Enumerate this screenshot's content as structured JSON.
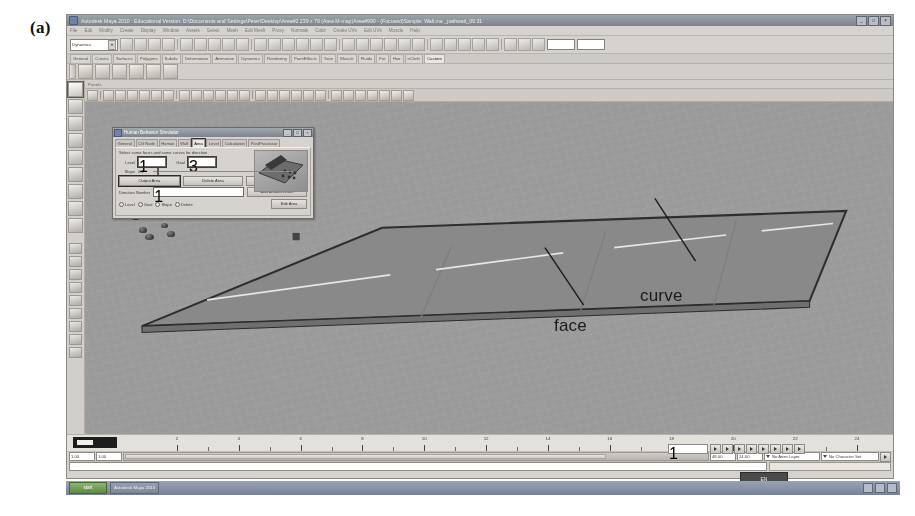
{
  "figure": {
    "label": "(a)"
  },
  "window": {
    "title": "Autodesk Maya 2010 : Educational Version: D:\\Documents and Settings\\Peter\\Desktop\\Area#2 239 x 79 (Area M-map)Area#990 - (Focused)Sample: Wall.ma    _pathwait_09.31",
    "minimize": "_",
    "maximize": "□",
    "close": "×",
    "icon": "maya-logo-icon"
  },
  "menubar": {
    "items": [
      "File",
      "Edit",
      "Modify",
      "Create",
      "Display",
      "Window",
      "Assets",
      "Select",
      "Mesh",
      "Edit Mesh",
      "Proxy",
      "Normals",
      "Color",
      "Create UVs",
      "Edit UVs",
      "Muscle",
      "Help"
    ]
  },
  "statusline": {
    "mode_label": "Dynamics",
    "mode_arrow": "▾",
    "field1": "",
    "field2": "",
    "field3": ""
  },
  "shelf": {
    "tabs": [
      "General",
      "Curves",
      "Surfaces",
      "Polygons",
      "Subdiv",
      "Deformation",
      "Animation",
      "Dynamics",
      "Rendering",
      "PaintEffects",
      "Toon",
      "Muscle",
      "Fluids",
      "Fur",
      "Hair",
      "nCloth",
      "Custom"
    ],
    "active_tab": "Custom",
    "icon_count": 6
  },
  "toolbox": {
    "tools": [
      "select-tool-icon",
      "lasso-select-icon",
      "paint-select-icon",
      "move-tool-icon",
      "rotate-tool-icon",
      "scale-tool-icon",
      "universal-manipulator-icon",
      "soft-modification-icon",
      "last-tool-icon"
    ],
    "layouts": [
      "single-perspective-view-icon",
      "four-view-layout-icon",
      "persp-outliner-layout-icon",
      "persp-graph-layout-icon",
      "hypershade-persp-layout-icon",
      "persp-uv-layout-icon",
      "two-pane-side-icon",
      "two-pane-stacked-icon",
      "single-pane-icon"
    ]
  },
  "viewport": {
    "panel_menu": "Panels",
    "annotations": [
      {
        "text": "face",
        "x": 569,
        "y": 289
      },
      {
        "text": "curve",
        "x": 655,
        "y": 259
      }
    ],
    "background_color": "#9b9b9b",
    "floor_color": "#8a8a8a",
    "agent_count": 22
  },
  "dialog": {
    "title": "Human Behavior Simulator",
    "icon": "hbs-window-icon",
    "buttons": {
      "minimize": "_",
      "maximize": "□",
      "close": "×"
    },
    "tabs": [
      "General",
      "CG Node",
      "Human",
      "Wall",
      "Area",
      "Level",
      "Calculation",
      "PostProcessor"
    ],
    "active_tab": "Area",
    "hint": "Select some faces and some curves for direction",
    "fields": [
      {
        "label": "Level",
        "value": "1"
      },
      {
        "label": "Goal",
        "value": "3"
      }
    ],
    "slope": {
      "label": "Slope",
      "value": "0.1"
    },
    "actions_row1": [
      "Output Area",
      "Delete Area",
      "Load Area"
    ],
    "direction": {
      "label": "Direction Number",
      "value": "1",
      "button": "Add AreaDirection"
    },
    "radios": [
      "Level",
      "Goal",
      "Slope",
      "Delete"
    ],
    "edit_button": "Edit Area",
    "preview": "scene-thumbnail"
  },
  "timeline": {
    "ticks": [
      2,
      4,
      6,
      8,
      10,
      12,
      14,
      16,
      18,
      20,
      22,
      24
    ],
    "current_frame": "1",
    "range_start": "1.00",
    "range_end": "24.00",
    "anim_start": "1.00",
    "anim_end": "48.00",
    "anim_layer": "No Anim Layer",
    "character_set": "No Character Set",
    "playback_controls": [
      "go-to-start-icon",
      "step-back-key-icon",
      "step-back-frame-icon",
      "play-backwards-icon",
      "play-forwards-icon",
      "step-forward-frame-icon",
      "step-forward-key-icon",
      "go-to-end-icon"
    ]
  },
  "command": {
    "input": "",
    "result": ""
  },
  "taskbar": {
    "start": "start",
    "items": [
      "Autodesk Maya 2010"
    ],
    "tray": [
      "network-icon",
      "volume-icon",
      "shield-icon"
    ]
  },
  "floating_button": {
    "label": "EN"
  }
}
